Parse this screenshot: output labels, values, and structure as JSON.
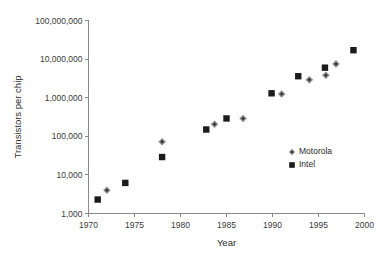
{
  "chart_data": {
    "type": "scatter",
    "title": "",
    "xlabel": "Year",
    "ylabel": "Transistors per chip",
    "xlim": [
      1970,
      2000
    ],
    "ylim": [
      1000,
      100000000
    ],
    "yscale": "log",
    "grid": false,
    "legend_position": "inside-right",
    "x_ticks": [
      1970,
      1975,
      1980,
      1985,
      1990,
      1995,
      2000
    ],
    "x_tick_labels": [
      "1970",
      "1975",
      "1980",
      "1985",
      "1990",
      "1995",
      "2000"
    ],
    "y_ticks": [
      1000,
      10000,
      100000,
      1000000,
      10000000,
      100000000
    ],
    "y_tick_labels": [
      "1,000",
      "10,000",
      "100,000",
      "1,000,000",
      "10,000,000",
      "100,000,000"
    ],
    "series": [
      {
        "name": "Motorola",
        "marker": "diamond",
        "color": "#8c8c8c",
        "points": [
          {
            "x": 1972.0,
            "y": 4000
          },
          {
            "x": 1978.0,
            "y": 72000
          },
          {
            "x": 1983.7,
            "y": 205000
          },
          {
            "x": 1986.8,
            "y": 290000
          },
          {
            "x": 1991.0,
            "y": 1250000
          },
          {
            "x": 1994.0,
            "y": 2900000
          },
          {
            "x": 1995.8,
            "y": 3800000
          },
          {
            "x": 1996.9,
            "y": 7500000
          }
        ]
      },
      {
        "name": "Intel",
        "marker": "square",
        "color": "#1b1b1b",
        "points": [
          {
            "x": 1971.0,
            "y": 2300
          },
          {
            "x": 1974.0,
            "y": 6200
          },
          {
            "x": 1978.0,
            "y": 29000
          },
          {
            "x": 1982.8,
            "y": 150000
          },
          {
            "x": 1985.0,
            "y": 290000
          },
          {
            "x": 1989.9,
            "y": 1300000
          },
          {
            "x": 1992.8,
            "y": 3600000
          },
          {
            "x": 1995.7,
            "y": 6000000
          },
          {
            "x": 1998.8,
            "y": 17000000
          }
        ]
      }
    ]
  },
  "legend": {
    "entries": [
      {
        "label": "Motorola",
        "marker": "diamond"
      },
      {
        "label": "Intel",
        "marker": "square"
      }
    ]
  }
}
